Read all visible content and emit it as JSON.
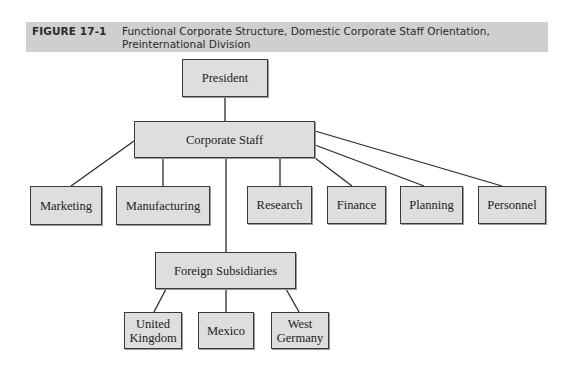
{
  "figure": {
    "label": "FIGURE 17-1",
    "caption": "Functional Corporate Structure, Domestic Corporate Staff Orientation, Preinternational Division",
    "banner_color": "#cfcfcf",
    "box_fill": "#dedede"
  },
  "nodes": {
    "president": "President",
    "corporate_staff": "Corporate Staff",
    "marketing": "Marketing",
    "manufacturing": "Manufacturing",
    "research": "Research",
    "finance": "Finance",
    "planning": "Planning",
    "personnel": "Personnel",
    "foreign_subsidiaries": "Foreign Subsidiaries",
    "united_kingdom": "United Kingdom",
    "mexico": "Mexico",
    "west_germany": "West Germany"
  },
  "edges": [
    [
      "President",
      "Corporate Staff"
    ],
    [
      "Corporate Staff",
      "Marketing"
    ],
    [
      "Corporate Staff",
      "Manufacturing"
    ],
    [
      "Corporate Staff",
      "Research"
    ],
    [
      "Corporate Staff",
      "Finance"
    ],
    [
      "Corporate Staff",
      "Planning"
    ],
    [
      "Corporate Staff",
      "Personnel"
    ],
    [
      "Corporate Staff",
      "Foreign Subsidiaries"
    ],
    [
      "Foreign Subsidiaries",
      "United Kingdom"
    ],
    [
      "Foreign Subsidiaries",
      "Mexico"
    ],
    [
      "Foreign Subsidiaries",
      "West Germany"
    ]
  ]
}
